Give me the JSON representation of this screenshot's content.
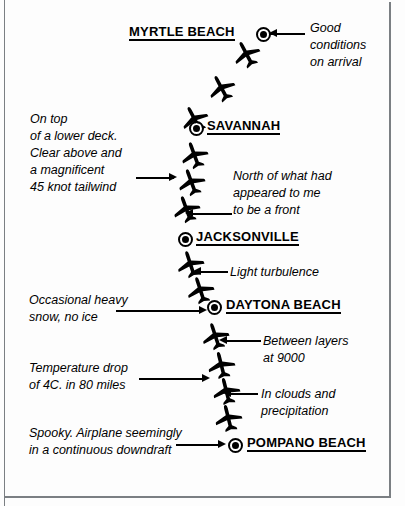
{
  "figure": {
    "colors": {
      "ink": "#000000",
      "frame": "#7b7f83",
      "paper": "#ffffff"
    }
  },
  "cities": [
    {
      "name": "MYRTLE BEACH",
      "label_x": 129,
      "label_y": 24,
      "marker_x": 258,
      "marker_y": 29
    },
    {
      "name": "SAVANNAH",
      "label_x": 207,
      "label_y": 118,
      "marker_x": 191,
      "marker_y": 123
    },
    {
      "name": "JACKSONVILLE",
      "label_x": 196,
      "label_y": 229,
      "marker_x": 180,
      "marker_y": 234
    },
    {
      "name": "DAYTONA BEACH",
      "label_x": 226,
      "label_y": 297,
      "marker_x": 209,
      "marker_y": 302
    },
    {
      "name": "POMPANO BEACH",
      "label_x": 247,
      "label_y": 435,
      "marker_x": 230,
      "marker_y": 440
    }
  ],
  "planes": [
    {
      "x": 232,
      "y": 38,
      "rot": -28
    },
    {
      "x": 207,
      "y": 72,
      "rot": -28
    },
    {
      "x": 180,
      "y": 103,
      "rot": -28
    },
    {
      "x": 180,
      "y": 139,
      "rot": -20
    },
    {
      "x": 177,
      "y": 166,
      "rot": -20
    },
    {
      "x": 172,
      "y": 193,
      "rot": -20
    },
    {
      "x": 176,
      "y": 248,
      "rot": -18
    },
    {
      "x": 186,
      "y": 274,
      "rot": -18
    },
    {
      "x": 201,
      "y": 320,
      "rot": -18
    },
    {
      "x": 207,
      "y": 349,
      "rot": -14
    },
    {
      "x": 212,
      "y": 375,
      "rot": -14
    },
    {
      "x": 214,
      "y": 402,
      "rot": -14
    }
  ],
  "annotations": [
    {
      "id": "good-conditions",
      "lines": [
        "Good",
        "conditions",
        "on arrival"
      ],
      "x": 310,
      "y": 20,
      "leader": {
        "x": 269,
        "y": 33,
        "width": 36,
        "arrow": "left",
        "arrow_x": 269,
        "arrow_y": 29
      }
    },
    {
      "id": "on-top-lower-deck",
      "lines": [
        "On top",
        "of a lower deck.",
        "Clear above and",
        "a magnificent",
        "45 knot tailwind"
      ],
      "x": 30,
      "y": 111,
      "leader": {
        "x": 136,
        "y": 177,
        "width": 38,
        "arrow": "right",
        "arrow_x": 169,
        "arrow_y": 173
      }
    },
    {
      "id": "north-of-front",
      "lines": [
        "North of what had",
        "appeared to me",
        "to be a front"
      ],
      "x": 233,
      "y": 168,
      "leader": {
        "x": 190,
        "y": 213,
        "width": 42,
        "arrow": "left",
        "arrow_x": 185,
        "arrow_y": 209
      }
    },
    {
      "id": "light-turbulence",
      "lines": [
        "Light turbulence"
      ],
      "x": 230,
      "y": 264,
      "leader": {
        "x": 198,
        "y": 271,
        "width": 30,
        "arrow": "left",
        "arrow_x": 193,
        "arrow_y": 267
      }
    },
    {
      "id": "occasional-heavy-snow",
      "lines": [
        "Occasional heavy",
        "snow, no ice"
      ],
      "x": 29,
      "y": 292,
      "leader": {
        "x": 116,
        "y": 310,
        "width": 85,
        "arrow": "right",
        "arrow_x": 199,
        "arrow_y": 306
      }
    },
    {
      "id": "between-layers",
      "lines": [
        "Between layers",
        "at 9000"
      ],
      "x": 263,
      "y": 333,
      "leader": {
        "x": 224,
        "y": 340,
        "width": 37,
        "arrow": "left",
        "arrow_x": 219,
        "arrow_y": 336
      }
    },
    {
      "id": "temperature-drop",
      "lines": [
        "Temperature drop",
        "of 4C. in 80 miles"
      ],
      "x": 29,
      "y": 360,
      "leader": {
        "x": 139,
        "y": 378,
        "width": 65,
        "arrow": "right",
        "arrow_x": 202,
        "arrow_y": 374
      }
    },
    {
      "id": "in-clouds",
      "lines": [
        "In clouds and",
        "precipitation"
      ],
      "x": 261,
      "y": 386,
      "leader": {
        "x": 228,
        "y": 393,
        "width": 30,
        "arrow": "left",
        "arrow_x": 223,
        "arrow_y": 389
      }
    },
    {
      "id": "spooky-downdraft",
      "lines": [
        "Spooky. Airplane seemingly",
        "in a continuous downdraft"
      ],
      "x": 29,
      "y": 425,
      "leader": {
        "x": 176,
        "y": 444,
        "width": 44,
        "arrow": "right",
        "arrow_x": 218,
        "arrow_y": 440
      }
    }
  ]
}
